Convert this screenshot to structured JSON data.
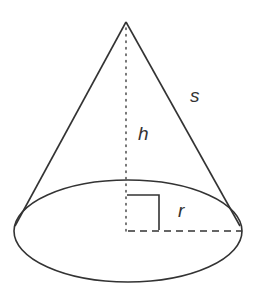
{
  "diagram": {
    "type": "right circular cone",
    "labels": {
      "height": "h",
      "slant": "s",
      "radius": "r"
    },
    "colors": {
      "stroke": "#333333",
      "background": "#ffffff"
    }
  }
}
